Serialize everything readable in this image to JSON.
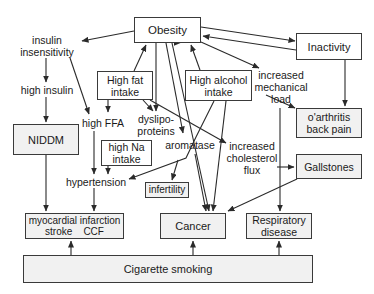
{
  "diagram": {
    "title": "",
    "nodes": {
      "obesity": {
        "lines": [
          "Obesity"
        ]
      },
      "inactivity": {
        "lines": [
          "Inactivity"
        ]
      },
      "insulin_insensitivity": {
        "lines": [
          "insulin",
          "insensitivity"
        ]
      },
      "high_insulin": {
        "lines": [
          "high insulin"
        ]
      },
      "niddm": {
        "lines": [
          "NIDDM"
        ]
      },
      "high_fat_intake": {
        "lines": [
          "High fat",
          "intake"
        ]
      },
      "high_alcohol_intake": {
        "lines": [
          "High alcohol",
          "intake"
        ]
      },
      "increased_mechanical_load": {
        "lines": [
          "increased",
          "mechanical",
          "load"
        ]
      },
      "oarthritis": {
        "lines": [
          "o'arthritis",
          "back pain"
        ]
      },
      "high_ffa": {
        "lines": [
          "high FFA"
        ]
      },
      "dyslipoproteins": {
        "lines": [
          "dyslipo-",
          "proteins"
        ]
      },
      "high_na_intake": {
        "lines": [
          "high Na",
          "intake"
        ]
      },
      "aromatase": {
        "lines": [
          "aromatase"
        ]
      },
      "increased_cholesterol_flux": {
        "lines": [
          "increased",
          "cholesterol",
          "flux"
        ]
      },
      "gallstones": {
        "lines": [
          "Gallstones"
        ]
      },
      "hypertension": {
        "lines": [
          "hypertension"
        ]
      },
      "infertility": {
        "lines": [
          "infertility"
        ]
      },
      "myocardial": {
        "lines": [
          "myocardial infarction",
          "stroke    CCF"
        ]
      },
      "cancer": {
        "lines": [
          "Cancer"
        ]
      },
      "respiratory": {
        "lines": [
          "Respiratory",
          "disease"
        ]
      },
      "cigarette_smoking": {
        "lines": [
          "Cigarette smoking"
        ]
      }
    },
    "edges": [
      [
        "obesity",
        "insulin_insensitivity"
      ],
      [
        "obesity",
        "inactivity"
      ],
      [
        "inactivity",
        "obesity"
      ],
      [
        "obesity",
        "increased_mechanical_load"
      ],
      [
        "obesity",
        "dyslipoproteins"
      ],
      [
        "obesity",
        "aromatase"
      ],
      [
        "obesity",
        "cancer"
      ],
      [
        "high_fat_intake",
        "obesity"
      ],
      [
        "high_alcohol_intake",
        "obesity"
      ],
      [
        "insulin_insensitivity",
        "high_insulin"
      ],
      [
        "insulin_insensitivity",
        "high_ffa"
      ],
      [
        "high_insulin",
        "niddm"
      ],
      [
        "high_fat_intake",
        "high_ffa"
      ],
      [
        "high_fat_intake",
        "dyslipoproteins"
      ],
      [
        "high_fat_intake",
        "increased_cholesterol_flux"
      ],
      [
        "inactivity",
        "oarthritis"
      ],
      [
        "increased_mechanical_load",
        "oarthritis"
      ],
      [
        "increased_mechanical_load",
        "respiratory"
      ],
      [
        "high_alcohol_intake",
        "hypertension"
      ],
      [
        "high_alcohol_intake",
        "cancer"
      ],
      [
        "high_alcohol_intake",
        "infertility"
      ],
      [
        "increased_cholesterol_flux",
        "gallstones"
      ],
      [
        "aromatase",
        "cancer"
      ],
      [
        "gallstones",
        "cancer"
      ],
      [
        "high_ffa",
        "hypertension"
      ],
      [
        "high_na_intake",
        "hypertension"
      ],
      [
        "niddm",
        "myocardial"
      ],
      [
        "hypertension",
        "myocardial"
      ],
      [
        "cigarette_smoking",
        "myocardial"
      ],
      [
        "cigarette_smoking",
        "cancer"
      ],
      [
        "cigarette_smoking",
        "respiratory"
      ]
    ],
    "colors": {
      "stroke": "#2a2a2a",
      "box_border": "#3a3a3a",
      "box_fill": "#ffffff",
      "shaded_fill": "#f1f1f1"
    }
  }
}
